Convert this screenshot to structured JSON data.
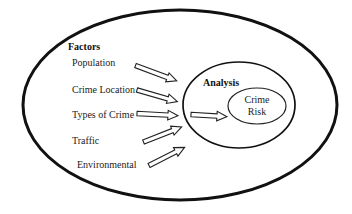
{
  "colors": {
    "ink": "#111111",
    "thin_ink": "#222222",
    "text": "#1c1c1c",
    "background": "#ffffff",
    "arrow_fill": "#ffffff"
  },
  "factors": {
    "title": "Factors",
    "items": [
      "Population",
      "Crime Location",
      "Types of Crime",
      "Traffic",
      "Environmental"
    ]
  },
  "analysis": {
    "title": "Analysis",
    "result_line1": "Crime",
    "result_line2": "Risk"
  }
}
